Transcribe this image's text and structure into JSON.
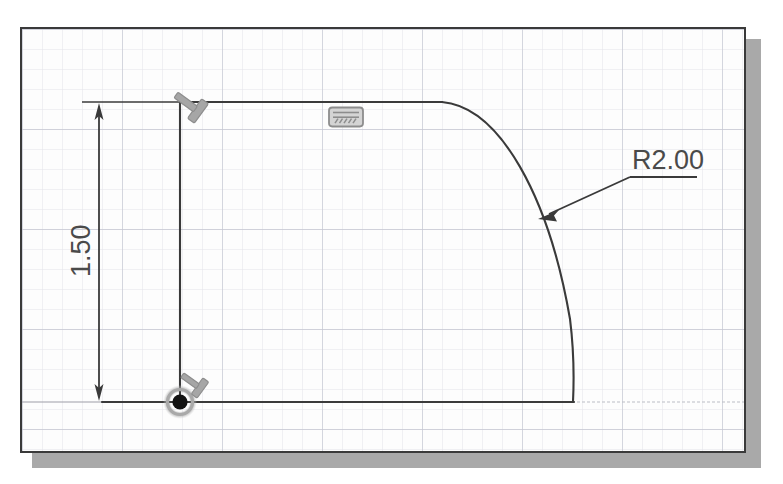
{
  "canvas": {
    "width": 783,
    "height": 484,
    "background_color": "#ffffff",
    "frame_border_color": "#3a3a3a",
    "frame_fill_color": "#fdfdfd",
    "shadow_color": "#9a9a9a"
  },
  "grid": {
    "minor_spacing_px": 20,
    "major_spacing_px": 100,
    "minor_color": "#e2e3ea",
    "major_color": "#c2c4cf",
    "visible": true
  },
  "sketch": {
    "geometry_color": "#3a3a3a",
    "construction_color": "#b9bac2",
    "profile": {
      "top_line": {
        "label": "horizontal-top-edge",
        "x1": 158,
        "y1": 73,
        "x2": 420,
        "y2": 73
      },
      "left_line": {
        "label": "vertical-left-edge",
        "x1": 158,
        "y1": 73,
        "x2": 158,
        "y2": 373
      },
      "bottom_line": {
        "label": "horizontal-bottom-edge",
        "x1": 80,
        "y1": 373,
        "x2": 550,
        "y2": 373
      },
      "arc": {
        "label": "fillet-arc",
        "start_x": 420,
        "start_y": 73,
        "end_x": 550,
        "end_y": 373,
        "radius_label": "R2.00"
      }
    }
  },
  "dimensions": [
    {
      "name": "vertical-dimension",
      "value": "1.50",
      "orientation": "vertical",
      "text_rotation_deg": -90,
      "line_x": 77,
      "line_y1": 73,
      "line_y2": 373,
      "text_x": 68,
      "text_y": 240,
      "color": "#4a4a4a"
    },
    {
      "name": "radius-dimension",
      "value": "R2.00",
      "orientation": "leader",
      "arrow_x": 520,
      "arrow_y": 188,
      "elbow_x": 608,
      "elbow_y": 148,
      "shelf_end_x": 675,
      "shelf_end_y": 148,
      "text_x": 612,
      "text_y": 142,
      "color": "#4a4a4a"
    }
  ],
  "constraint_icons": [
    {
      "name": "perpendicular-constraint-icon",
      "glyph": "T-shaped perpendicular symbol",
      "x": 176,
      "y": 82,
      "rotation_deg": 125,
      "color": "#9a9a9a"
    },
    {
      "name": "horizontal-constraint-icon",
      "glyph": "hatched rectangle",
      "x": 324,
      "y": 88,
      "rotation_deg": 0,
      "color": "#9a9a9a"
    }
  ],
  "origin": {
    "name": "sketch-origin-point",
    "x": 158,
    "y": 373,
    "dot_color": "#151515",
    "halo_color": "#b0b0b0",
    "cursor_icon": "pin-cursor-icon"
  },
  "labels": {
    "radius_text": "R2.00",
    "height_text": "1.50"
  }
}
